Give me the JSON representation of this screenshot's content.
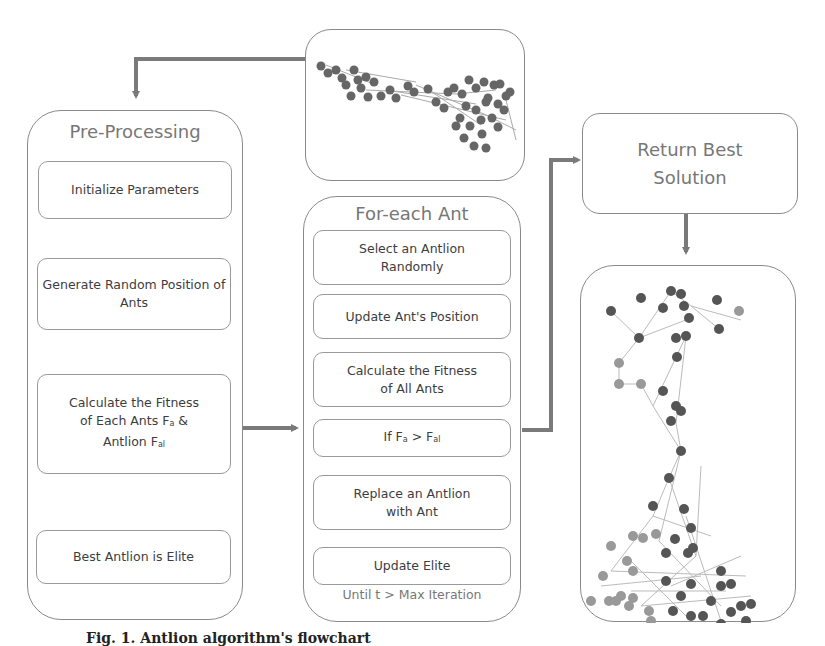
{
  "preprocessing": {
    "title": "Pre-Processing",
    "steps": [
      "Initialize Parameters",
      "Generate Random Position of Ants",
      "Calculate the Fitness of Each Ants Fa & Antlion Fal",
      "Best Antlion is Elite"
    ]
  },
  "loop": {
    "title": "For-each Ant",
    "steps": [
      "Select an Antlion Randomly",
      "Update Ant's Position",
      "Calculate the Fitness of All Ants",
      "If Fa > Fal",
      "Replace an Antlion with Ant",
      "Update Elite"
    ],
    "footer": "Until t > Max Iteration"
  },
  "result": {
    "title": "Return Best Solution"
  },
  "graphs": {
    "input_graph": "initial-network-graph",
    "output_graph": "clustered-network-graph"
  },
  "caption": "Fig. 1. Antlion algorithm's flowchart",
  "colors": {
    "border": "#8a8a8a",
    "arrow": "#7a7a7a",
    "node_dark": "#555555",
    "node_light": "#9a9a9a",
    "edge": "#bbbbbb"
  }
}
